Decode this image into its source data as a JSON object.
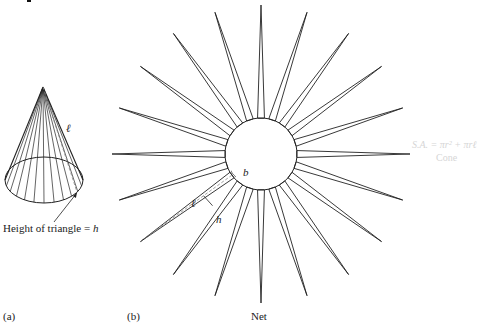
{
  "figure": {
    "panel_a": {
      "label": "(a)",
      "annotation": "Height of triangle = ",
      "annotation_var": "h",
      "slant_label": "ℓ",
      "cone": {
        "apex": [
          43,
          87
        ],
        "base_center": [
          44,
          180
        ],
        "rx": 39,
        "ry": 23,
        "generator_count": 12
      }
    },
    "panel_b": {
      "label": "(b)",
      "caption": "Net",
      "labels": {
        "slant": "ℓ",
        "height": "h",
        "base": "b"
      },
      "net": {
        "center": [
          261,
          154
        ],
        "circle_radius": 36,
        "spike_radius": 149,
        "spike_count": 20,
        "start_angle_deg": 90,
        "base_half_angle_deg": 5.5,
        "highlighted_spike_index": 13
      }
    },
    "formula": {
      "text": "S.A. = πr² + πrℓ",
      "caption": "Cone",
      "color": "#d6d6d6"
    },
    "colors": {
      "line": "#222222",
      "dashed": "#888888",
      "background": "#ffffff"
    }
  }
}
